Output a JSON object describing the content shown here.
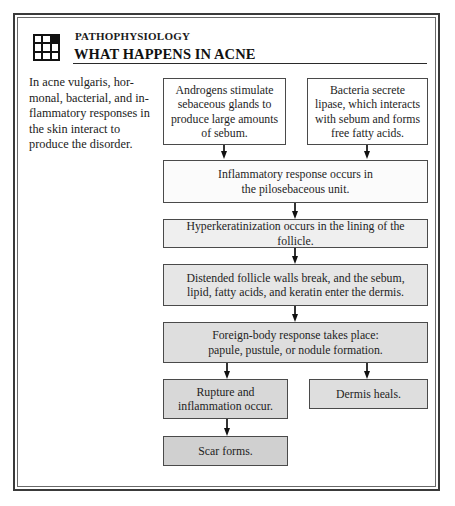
{
  "header": {
    "kicker": "PATHOPHYSIOLOGY",
    "title": "WHAT HAPPENS IN ACNE",
    "icon": "grid-3x3-icon"
  },
  "intro": {
    "text": "In acne vulgaris, hor-monal, bacterial, and in-flammatory responses in the skin interact to produce the disorder."
  },
  "flowchart": {
    "boxes": [
      {
        "id": "androgens",
        "text": "Androgens stimulate sebaceous glands to produce large amounts of sebum.",
        "fill": "#ffffff"
      },
      {
        "id": "bacteria",
        "text": "Bacteria secrete lipase, which interacts with sebum and forms free fatty acids.",
        "fill": "#ffffff"
      },
      {
        "id": "inflammatory",
        "text": "Inflammatory response occurs in the pilosebaceous unit.",
        "fill": "#fbfbfb"
      },
      {
        "id": "hyperkeratinization",
        "text": "Hyperkeratinization occurs in the lining of the follicle.",
        "fill": "#efefef"
      },
      {
        "id": "distended",
        "text": "Distended follicle walls break, and the sebum, lipid, fatty acids, and keratin enter the dermis.",
        "fill": "#e6e6e6"
      },
      {
        "id": "foreign-body",
        "text": "Foreign-body response takes place: papule, pustule, or nodule formation.",
        "fill": "#dedede"
      },
      {
        "id": "rupture",
        "text": "Rupture and inflammation occur.",
        "fill": "#d8d8d8"
      },
      {
        "id": "dermis-heals",
        "text": "Dermis heals.",
        "fill": "#dedede"
      },
      {
        "id": "scar",
        "text": "Scar forms.",
        "fill": "#d0d0d0"
      }
    ]
  },
  "colors": {
    "frame": "#3a3a3a",
    "text": "#1a1a1a",
    "arrow": "#111111"
  }
}
